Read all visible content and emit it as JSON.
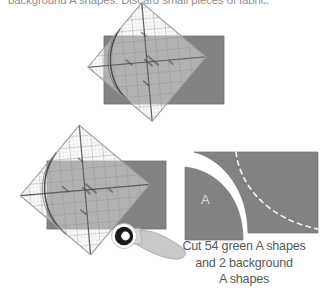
{
  "figure": {
    "kind": "quilting-cutting-instruction-diagram",
    "intro_text": "background A shapes. Discard small pieces of fabric.",
    "caption_lines": [
      "Cut 54 green A shapes",
      "and 2 background",
      "A shapes"
    ],
    "shape_label": "A",
    "colors": {
      "fabric_gray": "#828282",
      "fabric_gray_dark": "#6f6f6f",
      "ruler_line": "#6b6b6b",
      "ruler_fill": "#f2f2f2",
      "text_gray": "#58595b",
      "intro_text_gray": "#8e8e8e",
      "shape_letter": "#d9d9d9",
      "blade_dark": "#1a1a1a",
      "handle_gray": "#c9c9c9",
      "stitch_line": "#f0f0f0",
      "page_background": "#ffffff"
    },
    "steps": [
      {
        "name": "step-one-ruler-on-fabric",
        "description": "rotated curved quilting ruler laid over gray fabric rectangle"
      },
      {
        "name": "step-two-cutting-with-rotary-cutter",
        "description": "rotated curved quilting ruler over gray fabric rectangle with rotary cutter tracing the curved edge"
      }
    ],
    "result_panel": {
      "name": "cut-result",
      "pieces": [
        {
          "name": "quarter-circle-a-shape",
          "label": "A"
        },
        {
          "name": "remaining-fabric-with-seam-line",
          "seam_line_style": "dashed"
        }
      ]
    }
  }
}
